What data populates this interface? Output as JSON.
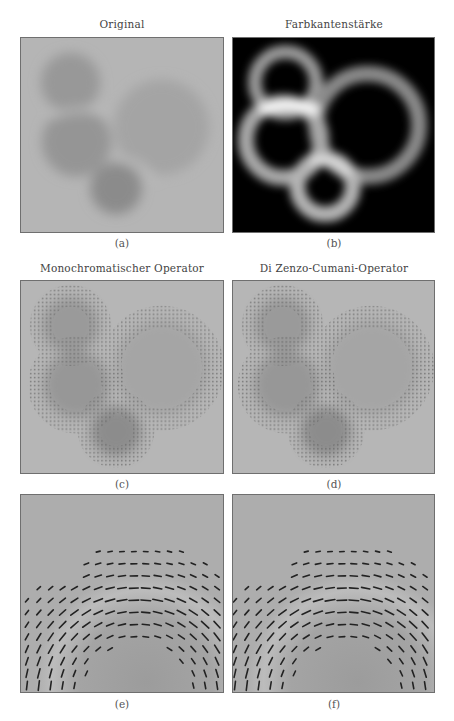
{
  "figure": {
    "panels": [
      {
        "id": "a",
        "title": "Original",
        "caption": "(a)"
      },
      {
        "id": "b",
        "title": "Farbkantenstärke",
        "caption": "(b)"
      },
      {
        "id": "c",
        "title": "Monochromatischer Operator",
        "caption": "(c)"
      },
      {
        "id": "d",
        "title": "Di Zenzo-Cumani-Operator",
        "caption": "(d)"
      },
      {
        "id": "e",
        "title": "",
        "caption": "(e)"
      },
      {
        "id": "f",
        "title": "",
        "caption": "(f)"
      }
    ]
  },
  "colors": {
    "background_gray": "#b4b4b4",
    "disk_gray": "#8f8f8f",
    "edge_black": "#000000",
    "border": "#6f6f6f"
  }
}
